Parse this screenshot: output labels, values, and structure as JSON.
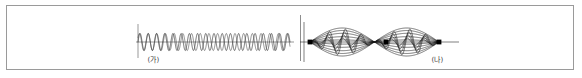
{
  "figure": {
    "width": 582,
    "height": 78,
    "background_color": "#ffffff",
    "border_color": "#9a9a9a",
    "panel_divider_color": "#8d8d8d"
  },
  "panels": [
    {
      "id": "traveling",
      "caption": "(가)",
      "description": "traveling-wave",
      "axis_color": "#555555",
      "wave_color": "#1d1d1d",
      "wave_color_secondary": "#4a4a4a"
    },
    {
      "id": "standing",
      "caption": "(나)",
      "description": "standing-wave",
      "axis_color": "#2a2a2a",
      "wave_color": "#1d1d1d",
      "envelope_color": "#1d1d1d",
      "node_color": "#000000"
    }
  ],
  "chart_data": {
    "type": "line",
    "title": "",
    "xlabel": "",
    "ylabel": "",
    "charts": [
      {
        "id": "traveling",
        "caption": "(가)",
        "type": "line",
        "description": "Two superimposed sinusoidal traveling waves of slightly different wavelength drawn on a common horizontal axis.",
        "axis": {
          "x_start": 131,
          "x_end": 283,
          "baseline_y": 36,
          "y_tick_x": 131,
          "y_tick_top": 18,
          "y_tick_bottom": 52
        },
        "series": [
          {
            "name": "wave-1",
            "amplitude": 8.5,
            "cycles": 18.5,
            "phase_deg": 0
          },
          {
            "name": "wave-2",
            "amplitude": 8.5,
            "cycles": 17.5,
            "phase_deg": 30
          }
        ]
      },
      {
        "id": "standing",
        "caption": "(나)",
        "type": "line",
        "description": "Standing wave with two antinode loops bounded by a lens-shaped envelope, with three nodes marked by filled dots.",
        "axis": {
          "x_start": 295,
          "x_end": 452,
          "baseline_y": 36,
          "y_tick_x": 297,
          "y_tick_top": 16,
          "y_tick_bottom": 56
        },
        "nodes": [
          {
            "label": "node-1",
            "x": 303,
            "y": 36
          },
          {
            "label": "node-2",
            "x": 379,
            "y": 36
          },
          {
            "label": "node-3",
            "x": 432,
            "y": 36
          }
        ],
        "envelope": {
          "amplitude": 14,
          "loops": 2
        },
        "series": [
          {
            "name": "snapshot-1",
            "phase_deg": 0,
            "amplitude_scale": 1.0
          },
          {
            "name": "snapshot-2",
            "phase_deg": 36,
            "amplitude_scale": 0.82
          },
          {
            "name": "snapshot-3",
            "phase_deg": 72,
            "amplitude_scale": 0.62
          },
          {
            "name": "snapshot-4",
            "phase_deg": 108,
            "amplitude_scale": 0.38
          },
          {
            "name": "snapshot-5",
            "phase_deg": 144,
            "amplitude_scale": 0.15
          }
        ]
      }
    ]
  }
}
